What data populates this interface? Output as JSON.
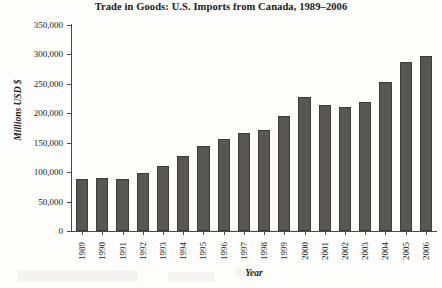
{
  "chart_data": {
    "type": "bar",
    "title": "Trade in Goods: U.S. Imports from Canada, 1989–2006",
    "xlabel": "Year",
    "ylabel": "Millions USD $",
    "ylim": [
      0,
      350000
    ],
    "ytick_labels": [
      "350,000",
      "300,000",
      "250,000",
      "200,000",
      "150,000",
      "100,000",
      "50,000",
      "0"
    ],
    "ytick_values": [
      350000,
      300000,
      250000,
      200000,
      150000,
      100000,
      50000,
      0
    ],
    "grid": false,
    "legend": "none",
    "bar_color": "#595755",
    "bar_edge_color": "#3d3b39",
    "categories": [
      "1989",
      "1990",
      "1991",
      "1992",
      "1993",
      "1994",
      "1995",
      "1996",
      "1997",
      "1998",
      "1999",
      "2000",
      "2001",
      "2002",
      "2003",
      "2004",
      "2005",
      "2006"
    ],
    "values": [
      88000,
      90000,
      89000,
      98000,
      111000,
      128000,
      144000,
      156000,
      167000,
      172000,
      196000,
      228000,
      214000,
      210000,
      220000,
      254000,
      287000,
      298000
    ]
  }
}
